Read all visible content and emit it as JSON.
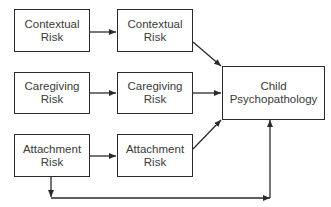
{
  "diagram": {
    "type": "path-model",
    "nodes": [
      {
        "id": "contextual-risk-1",
        "line1": "Contextual",
        "line2": "Risk"
      },
      {
        "id": "contextual-risk-2",
        "line1": "Contextual",
        "line2": "Risk"
      },
      {
        "id": "caregiving-risk-1",
        "line1": "Caregiving",
        "line2": "Risk"
      },
      {
        "id": "caregiving-risk-2",
        "line1": "Caregiving",
        "line2": "Risk"
      },
      {
        "id": "attachment-risk-1",
        "line1": "Attachment",
        "line2": "Risk"
      },
      {
        "id": "attachment-risk-2",
        "line1": "Attachment",
        "line2": "Risk"
      },
      {
        "id": "child-psychopathology",
        "line1": "Child",
        "line2": "Psychopathology"
      }
    ],
    "edges": [
      {
        "from": "contextual-risk-1",
        "to": "contextual-risk-2"
      },
      {
        "from": "caregiving-risk-1",
        "to": "caregiving-risk-2"
      },
      {
        "from": "attachment-risk-1",
        "to": "attachment-risk-2"
      },
      {
        "from": "contextual-risk-2",
        "to": "child-psychopathology"
      },
      {
        "from": "caregiving-risk-2",
        "to": "child-psychopathology"
      },
      {
        "from": "attachment-risk-2",
        "to": "child-psychopathology"
      },
      {
        "from": "attachment-risk-1",
        "to": "child-psychopathology",
        "routing": "elbow-below"
      }
    ],
    "colors": {
      "stroke": "#2a2a2a",
      "text": "#3a3a3a",
      "background": "#ffffff"
    }
  }
}
